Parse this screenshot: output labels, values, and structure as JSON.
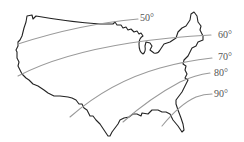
{
  "map": {
    "subject": "Contiguous United States outline with isotherm lines",
    "colors": {
      "background": "#ffffff",
      "outline": "#222222",
      "isotherm": "#9a9a9a",
      "label": "#555555"
    },
    "isotherms": [
      {
        "label": "50°",
        "value": 50
      },
      {
        "label": "60°",
        "value": 60
      },
      {
        "label": "70°",
        "value": 70
      },
      {
        "label": "80°",
        "value": 80
      },
      {
        "label": "90°",
        "value": 90
      }
    ]
  }
}
